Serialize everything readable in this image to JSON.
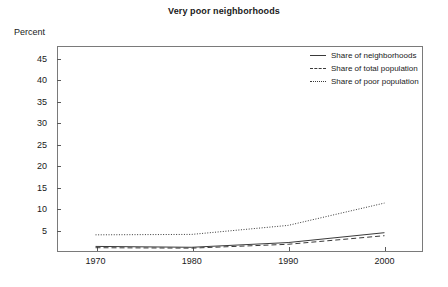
{
  "chart_data": {
    "type": "line",
    "title": "Very poor neighborhoods",
    "xlabel": "",
    "ylabel": "Percent",
    "x": [
      1970,
      1980,
      1990,
      2000
    ],
    "xtick_labels": [
      "1970",
      "1980",
      "1990",
      "2000"
    ],
    "ytick_labels": [
      "5",
      "10",
      "15",
      "20",
      "25",
      "30",
      "35",
      "40",
      "45"
    ],
    "ytick_values": [
      5,
      10,
      15,
      20,
      25,
      30,
      35,
      40,
      45
    ],
    "ylim": [
      0,
      48
    ],
    "xlim": [
      1966,
      2004
    ],
    "grid": false,
    "legend_position": "top-right",
    "series": [
      {
        "name": "Share of neighborhoods",
        "style": "solid",
        "color": "#3a3a3a",
        "values": [
          1.3,
          1.1,
          2.2,
          4.5
        ]
      },
      {
        "name": "Share of total population",
        "style": "dashed",
        "color": "#3a3a3a",
        "values": [
          1.0,
          0.9,
          1.8,
          3.8
        ]
      },
      {
        "name": "Share of poor population",
        "style": "dotted",
        "color": "#3a3a3a",
        "values": [
          4.0,
          4.1,
          6.2,
          11.4
        ]
      }
    ]
  },
  "legend": {
    "entries": [
      {
        "label": "Share of neighborhoods"
      },
      {
        "label": "Share of total population"
      },
      {
        "label": "Share of poor population"
      }
    ]
  },
  "colors": {
    "line": "#3a3a3a",
    "frame": "#7a7a7a",
    "text": "#1a1a1a"
  }
}
